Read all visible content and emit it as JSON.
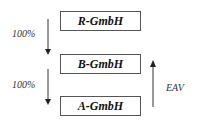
{
  "diagram": {
    "entities": [
      {
        "id": "r",
        "label": "R-GmbH"
      },
      {
        "id": "b",
        "label": "B-GmbH"
      },
      {
        "id": "a",
        "label": "A-GmbH"
      }
    ],
    "relations": [
      {
        "from": "R-GmbH",
        "to": "B-GmbH",
        "label": "100%",
        "direction": "down"
      },
      {
        "from": "B-GmbH",
        "to": "A-GmbH",
        "label": "100%",
        "direction": "down"
      },
      {
        "from": "A-GmbH",
        "to": "B-GmbH",
        "label": "EAV",
        "direction": "up"
      }
    ]
  }
}
